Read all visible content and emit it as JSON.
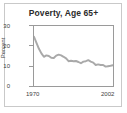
{
  "chart_data": {
    "type": "line",
    "title": "Poverty, Age 65+",
    "xlabel": "",
    "ylabel": "Percent",
    "xlim": [
      1970,
      2002
    ],
    "ylim": [
      0,
      30
    ],
    "yticks": [
      0,
      10,
      20,
      30
    ],
    "xticks": [
      1970,
      2002
    ],
    "xtick_labels": [
      "1970",
      "2002"
    ],
    "ytick_labels": [
      "0",
      "10",
      "20",
      "30"
    ],
    "grid": false,
    "legend": null,
    "line_color": "#a9a9a9",
    "series": [
      {
        "name": "Poverty rate, age 65+",
        "x": [
          1970,
          1971,
          1972,
          1973,
          1974,
          1975,
          1976,
          1977,
          1978,
          1979,
          1980,
          1981,
          1982,
          1983,
          1984,
          1985,
          1986,
          1987,
          1988,
          1989,
          1990,
          1991,
          1992,
          1993,
          1994,
          1995,
          1996,
          1997,
          1998,
          1999,
          2000,
          2001,
          2002
        ],
        "values": [
          24.6,
          21.6,
          18.6,
          16.3,
          14.6,
          15.3,
          15.0,
          14.1,
          14.0,
          15.2,
          15.7,
          15.3,
          14.6,
          13.8,
          12.4,
          12.6,
          12.4,
          12.5,
          12.0,
          11.4,
          12.2,
          12.4,
          12.9,
          12.2,
          11.7,
          10.5,
          10.8,
          10.5,
          10.5,
          9.7,
          9.9,
          10.1,
          10.4
        ]
      }
    ]
  },
  "axes": {
    "y_tick_0": "0",
    "y_tick_10": "10",
    "y_tick_20": "20",
    "y_tick_30": "30",
    "x_tick_start": "1970",
    "x_tick_end": "2002",
    "y_axis_label": "Percent"
  },
  "figure": {
    "title": "Poverty, Age 65+"
  }
}
